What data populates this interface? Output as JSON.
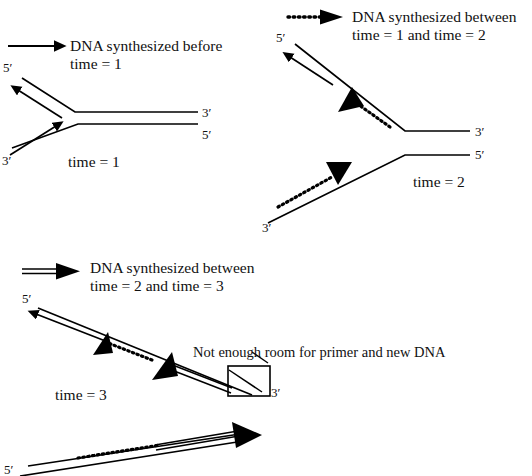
{
  "figure": {
    "background_color": "#ffffff",
    "ink_color": "#000000"
  },
  "legends": [
    {
      "id": "legend-before-time-1",
      "line_style": "solid",
      "icon": "solid-line-arrow-icon",
      "line1": "DNA synthesized before",
      "line2": "time = 1"
    },
    {
      "id": "legend-between-1-and-2",
      "line_style": "dotted",
      "icon": "dotted-line-arrow-icon",
      "line1": "DNA synthesized between",
      "line2": "time = 1 and time = 2"
    },
    {
      "id": "legend-between-2-and-3",
      "line_style": "double",
      "icon": "double-line-arrow-icon",
      "line1": "DNA synthesized between",
      "line2": "time = 2 and time = 3"
    }
  ],
  "panels": [
    {
      "id": "panel-time-1",
      "time_label": "time = 1",
      "end_labels": {
        "upper_left": "5′",
        "lower_left": "3′",
        "upper_right": "3′",
        "lower_right": "5′"
      }
    },
    {
      "id": "panel-time-2",
      "time_label": "time = 2",
      "end_labels": {
        "upper_left": "5′",
        "lower_left": "3′",
        "upper_right": "3′",
        "lower_right": "5′"
      }
    },
    {
      "id": "panel-time-3",
      "time_label": "time = 3",
      "end_labels": {
        "upper_left": "5′",
        "box_right": "3′",
        "bottom_left": "5′"
      },
      "annotation": "Not enough room for primer and new DNA"
    }
  ]
}
